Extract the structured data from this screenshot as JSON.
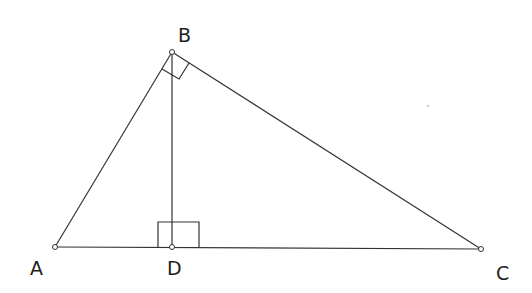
{
  "diagram": {
    "points": {
      "A": {
        "label": "A",
        "x": 55,
        "y": 247
      },
      "B": {
        "label": "B",
        "x": 172,
        "y": 52
      },
      "C": {
        "label": "C",
        "x": 481,
        "y": 249
      },
      "D": {
        "label": "D",
        "x": 172,
        "y": 247
      }
    },
    "segments": [
      "AB",
      "BC",
      "AC",
      "BD"
    ],
    "right_angles": [
      "B",
      "D"
    ],
    "colors": {
      "stroke": "#333333",
      "background": "#ffffff"
    }
  }
}
